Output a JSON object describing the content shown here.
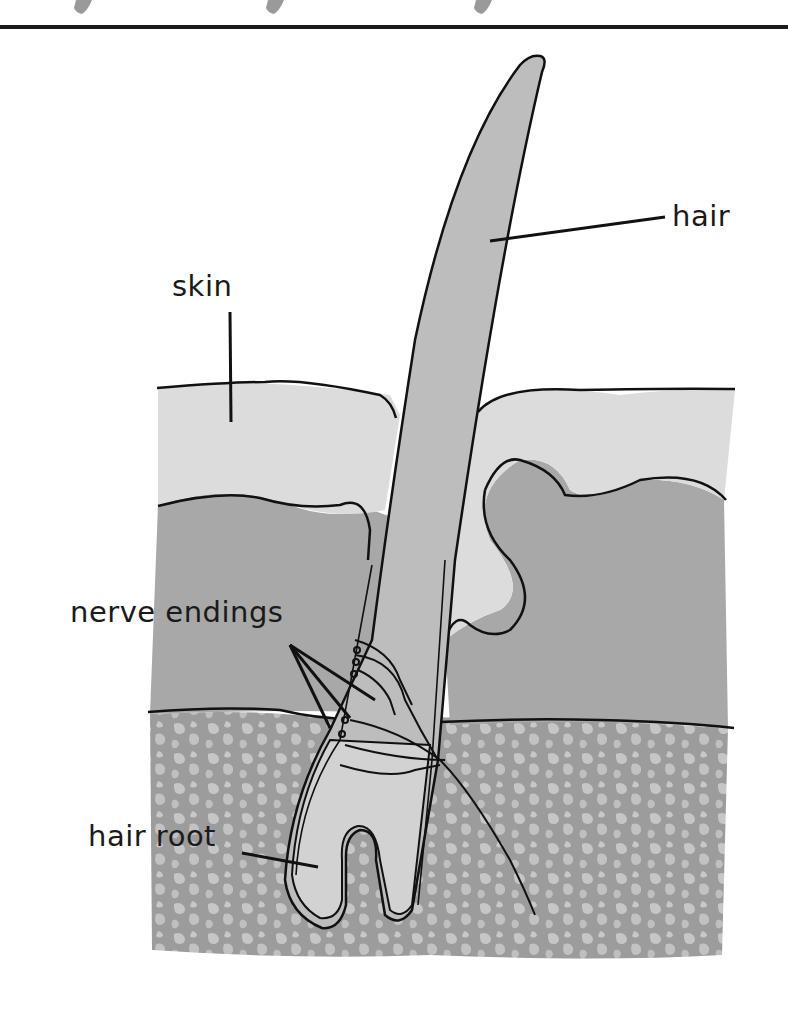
{
  "diagram": {
    "labels": {
      "hair": "hair",
      "skin": "skin",
      "nerve_endings": "nerve endings",
      "hair_root": "hair root"
    },
    "colors": {
      "background": "#ffffff",
      "outline": "#111111",
      "epidermis": "#dcdcdc",
      "dermis": "#a8a8a8",
      "subcutaneous": "#9c9c9c",
      "subcutaneous_spots": "#c4c4c4",
      "hair": "#bdbdbd",
      "hair_root": "#d2d2d2",
      "top_marks": "#9a9a9a"
    }
  }
}
